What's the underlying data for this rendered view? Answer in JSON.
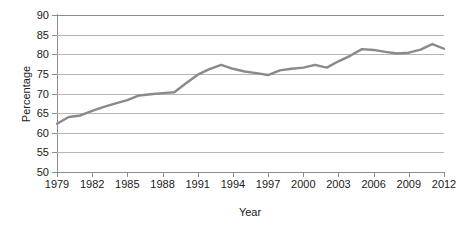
{
  "chart_data": {
    "type": "line",
    "title": "",
    "xlabel": "Year",
    "ylabel": "Percentage",
    "xlim": [
      1979,
      2012
    ],
    "ylim": [
      50,
      90
    ],
    "ytick_step": 5,
    "xtick_step": 3,
    "grid": "horizontal",
    "legend": "none",
    "line_color": "#8a8a8a",
    "grid_color": "#b5b5b5",
    "axis_color": "#8c8c8c",
    "yticks": [
      50,
      55,
      60,
      65,
      70,
      75,
      80,
      85,
      90
    ],
    "xticks": [
      1979,
      1982,
      1985,
      1988,
      1991,
      1994,
      1997,
      2000,
      2003,
      2006,
      2009,
      2012
    ],
    "x": [
      1979,
      1980,
      1981,
      1982,
      1983,
      1984,
      1985,
      1986,
      1987,
      1988,
      1989,
      1990,
      1991,
      1992,
      1993,
      1994,
      1995,
      1996,
      1997,
      1998,
      1999,
      2000,
      2001,
      2002,
      2003,
      2004,
      2005,
      2006,
      2007,
      2008,
      2009,
      2010,
      2011,
      2012
    ],
    "values": [
      62.3,
      64.0,
      64.4,
      65.6,
      66.6,
      67.5,
      68.3,
      69.5,
      69.8,
      70.1,
      70.3,
      72.6,
      74.8,
      76.2,
      77.3,
      76.3,
      75.6,
      75.2,
      74.7,
      75.9,
      76.3,
      76.6,
      77.3,
      76.6,
      78.2,
      79.6,
      81.3,
      81.1,
      80.6,
      80.2,
      80.4,
      81.2,
      82.6,
      81.4
    ],
    "series_name": "Percentage"
  }
}
